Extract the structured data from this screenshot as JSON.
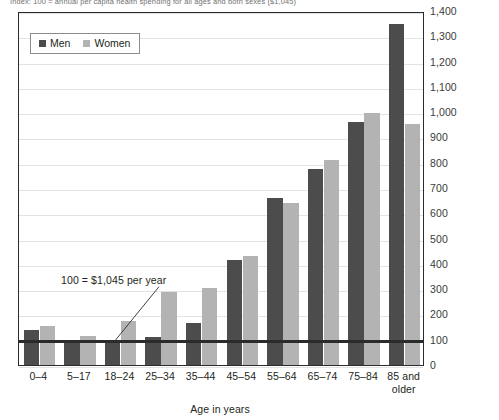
{
  "top_note": "Index: 100 = annual per capita health spending for all ages and both sexes ($1,045)",
  "legend": {
    "men_label": "Men",
    "women_label": "Women",
    "men_color": "#4c4c4c",
    "women_color": "#b3b3b3"
  },
  "annotation": {
    "text": "100 = $1,045 per year"
  },
  "axis": {
    "x_title": "Age in years"
  },
  "chart_data": {
    "type": "bar",
    "title": "",
    "subtitle": "",
    "xlabel": "Age in years",
    "ylabel": "",
    "ylim": [
      0,
      1400
    ],
    "ytick_step": 100,
    "grid": true,
    "legend_position": "top-left",
    "categories": [
      "0–4",
      "5–17",
      "18–24",
      "25–34",
      "35–44",
      "45–54",
      "55–64",
      "65–74",
      "75–84",
      "85 and older"
    ],
    "ytick_labels": [
      "1,400",
      "1,300",
      "1,200",
      "1,100",
      "1,000",
      "900",
      "800",
      "700",
      "600",
      "500",
      "400",
      "300",
      "200",
      "100",
      "0"
    ],
    "series": [
      {
        "name": "Men",
        "color": "#4c4c4c",
        "values": [
          140,
          90,
          90,
          110,
          165,
          415,
          660,
          775,
          960,
          1350
        ]
      },
      {
        "name": "Women",
        "color": "#b3b3b3",
        "values": [
          155,
          115,
          175,
          290,
          305,
          430,
          640,
          810,
          995,
          955
        ]
      }
    ],
    "reference_line": {
      "value": 100,
      "label": "100 = $1,045 per year",
      "color": "#2b2b2b"
    }
  }
}
